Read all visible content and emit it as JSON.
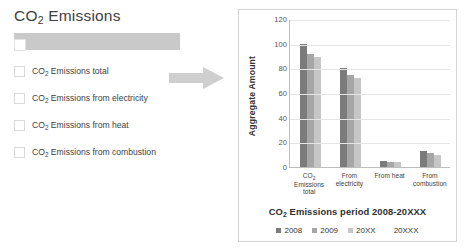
{
  "left_panel": {
    "title_main": "CO",
    "title_sub": "2",
    "title_rest": " Emissions",
    "highlight_row": {
      "label": ""
    },
    "options": [
      {
        "pre": "CO",
        "sub": "2",
        "post": " Emissions total"
      },
      {
        "pre": "CO",
        "sub": "2",
        "post": " Emissions from electricity"
      },
      {
        "pre": "CO",
        "sub": "2",
        "post": " Emissions from heat"
      },
      {
        "pre": "CO",
        "sub": "2",
        "post": " Emissions from combustion"
      }
    ]
  },
  "arrow": {
    "name": "right-arrow"
  },
  "chart_data": {
    "type": "bar",
    "title": "CO2 Emissions period 2008-20XXX",
    "title_pre": "CO",
    "title_sub": "2",
    "title_post": " Emissions period 2008-20XXX",
    "xlabel": "",
    "ylabel": "Aggregate Amount",
    "ylim": [
      0,
      120
    ],
    "yticks": [
      0,
      20,
      40,
      60,
      80,
      100,
      120
    ],
    "ytick_labels": [
      "0",
      "20",
      "40",
      "60",
      "80",
      "100",
      "120"
    ],
    "grid": true,
    "legend_position": "bottom",
    "categories": [
      "CO2 Emissions total",
      "From electricity",
      "From heat",
      "From combustion"
    ],
    "category_labels": [
      {
        "pre": "CO",
        "sub": "2",
        "post": " Emissions total"
      },
      {
        "pre": "",
        "sub": "",
        "post": "From electricity"
      },
      {
        "pre": "",
        "sub": "",
        "post": "From heat"
      },
      {
        "pre": "",
        "sub": "",
        "post": "From combustion"
      }
    ],
    "series": [
      {
        "name": "2008",
        "color": "#7b7b7b",
        "values": [
          100,
          80,
          5,
          13
        ]
      },
      {
        "name": "2009",
        "color": "#a6a6a6",
        "values": [
          92,
          75,
          4,
          11
        ]
      },
      {
        "name": "20XX",
        "color": "#c6c6c6",
        "values": [
          89,
          72,
          4,
          10
        ]
      },
      {
        "name": "20XXX",
        "color": "#ffffff",
        "values": [
          0,
          0,
          0,
          0
        ]
      }
    ],
    "legend": [
      "2008",
      "2009",
      "20XX",
      "20XXX"
    ]
  },
  "colors": {
    "series_2008": "#7b7b7b",
    "series_2009": "#a6a6a6",
    "series_20XX": "#c6c6c6",
    "highlight_bar": "#c9c9c9",
    "arrow": "#cfcfcf",
    "panel_border": "#d4d4d4"
  }
}
